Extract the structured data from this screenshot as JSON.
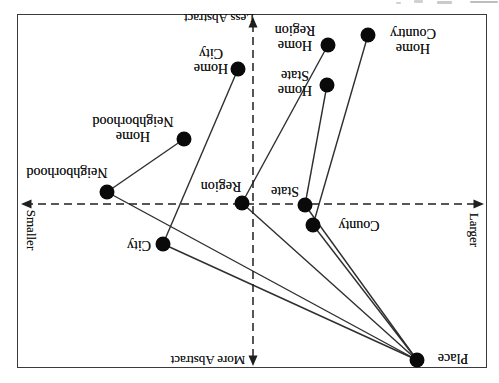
{
  "colors": {
    "background": "#ffffff",
    "ink": "#141414",
    "edge_line": "#2e2e2e",
    "dashed_axis": "#1f1f1f",
    "dot": "#0a0a0a",
    "border": "#3a3a3a"
  },
  "chart_data": {
    "type": "scatter",
    "title": "",
    "axes": {
      "vertical": {
        "top_label": "More Abstract",
        "bottom_label": "Less Abstract"
      },
      "horizontal": {
        "left_label": "Larger",
        "right_label": "Smaller"
      }
    },
    "points": [
      {
        "id": "place",
        "label": "Place",
        "label_lines": [
          "Place"
        ],
        "x": 82,
        "y": 23,
        "lx": 46,
        "ly": 25
      },
      {
        "id": "county",
        "label": "County",
        "label_lines": [
          "County"
        ],
        "x": 186,
        "y": 158,
        "lx": 140,
        "ly": 158
      },
      {
        "id": "state",
        "label": "State",
        "label_lines": [
          "State"
        ],
        "x": 194,
        "y": 178,
        "lx": 214,
        "ly": 192
      },
      {
        "id": "region",
        "label": "Region",
        "label_lines": [
          "Region"
        ],
        "x": 257,
        "y": 180,
        "lx": 278,
        "ly": 197
      },
      {
        "id": "city",
        "label": "City",
        "label_lines": [
          "City"
        ],
        "x": 336,
        "y": 139,
        "lx": 360,
        "ly": 138
      },
      {
        "id": "neighborhood",
        "label": "Neighborhood",
        "label_lines": [
          "Neighborhood"
        ],
        "x": 392,
        "y": 191,
        "lx": 432,
        "ly": 211
      },
      {
        "id": "home-neighborhood",
        "label": "Home Neighborhood",
        "label_lines": [
          "Home",
          "Neighborhood"
        ],
        "x": 315,
        "y": 244,
        "lx": 366,
        "ly": 254
      },
      {
        "id": "home-city",
        "label": "Home City",
        "label_lines": [
          "Home",
          "City"
        ],
        "x": 261,
        "y": 314,
        "lx": 288,
        "ly": 322
      },
      {
        "id": "home-state",
        "label": "Home State",
        "label_lines": [
          "Home",
          "State"
        ],
        "x": 172,
        "y": 298,
        "lx": 204,
        "ly": 300
      },
      {
        "id": "home-region",
        "label": "Home Region",
        "label_lines": [
          "Home",
          "Region"
        ],
        "x": 171,
        "y": 338,
        "lx": 204,
        "ly": 345
      },
      {
        "id": "home-country",
        "label": "Home Country",
        "label_lines": [
          "Home",
          "Country"
        ],
        "x": 131,
        "y": 348,
        "lx": 86,
        "ly": 342
      }
    ],
    "edges": [
      [
        "place",
        "county"
      ],
      [
        "place",
        "state"
      ],
      [
        "place",
        "region"
      ],
      [
        "place",
        "city"
      ],
      [
        "place",
        "neighborhood"
      ],
      [
        "county",
        "home-country"
      ],
      [
        "state",
        "home-state"
      ],
      [
        "region",
        "home-region"
      ],
      [
        "city",
        "home-city"
      ],
      [
        "neighborhood",
        "home-neighborhood"
      ]
    ],
    "layout": {
      "width": 499,
      "height": 383,
      "rotated_degrees": 180,
      "grid": false,
      "border": {
        "left": 12,
        "top": 15,
        "right": 482,
        "bottom": 369
      },
      "vline_x": 246,
      "vline_tip_top_y": 17,
      "vline_tip_bottom_y": 366,
      "hline_y": 179,
      "hline_tip_left_x": 15,
      "hline_tip_right_x": 478,
      "dot_radius": 7.5,
      "top_edge_cropped_text_artifacts": true
    }
  }
}
